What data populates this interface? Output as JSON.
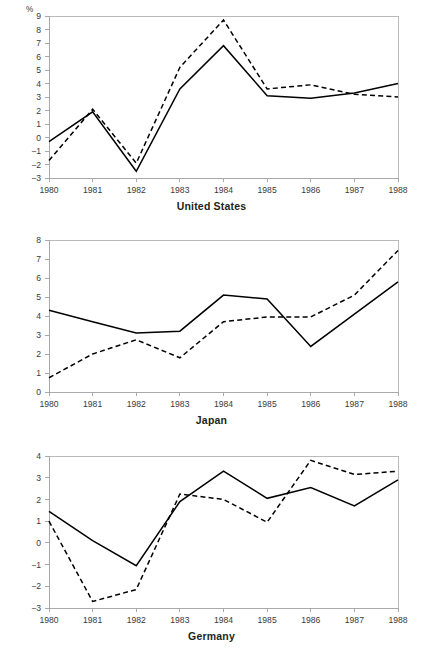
{
  "unit_label": "%",
  "panels": [
    {
      "name": "united-states",
      "title": "United States",
      "ymin": -3,
      "ymax": 9,
      "yticks": [
        -3,
        -2,
        -1,
        0,
        1,
        2,
        3,
        4,
        5,
        6,
        7,
        8,
        9
      ],
      "ytick_labels": [
        "−3",
        "−2",
        "−1",
        "0",
        "1",
        "2",
        "3",
        "4",
        "5",
        "6",
        "7",
        "8",
        "9"
      ],
      "zero_line": 0
    },
    {
      "name": "japan",
      "title": "Japan",
      "ymin": 0,
      "ymax": 8,
      "yticks": [
        0,
        1,
        2,
        3,
        4,
        5,
        6,
        7,
        8
      ],
      "ytick_labels": [
        "0",
        "1",
        "2",
        "3",
        "4",
        "5",
        "6",
        "7",
        "8"
      ],
      "zero_line": 0
    },
    {
      "name": "germany",
      "title": "Germany",
      "ymin": -3,
      "ymax": 4,
      "yticks": [
        -3,
        -2,
        -1,
        0,
        1,
        2,
        3,
        4
      ],
      "ytick_labels": [
        "−3",
        "−2",
        "−1",
        "0",
        "1",
        "2",
        "3",
        "4"
      ],
      "zero_line": 0
    }
  ],
  "chart_data": [
    {
      "type": "line",
      "title": "United States",
      "xlabel": "",
      "ylabel": "%",
      "categories": [
        "1980",
        "1981",
        "1982",
        "1983",
        "1984",
        "1985",
        "1986",
        "1987",
        "1988"
      ],
      "x": [
        1980,
        1981,
        1982,
        1983,
        1984,
        1985,
        1986,
        1987,
        1988
      ],
      "ylim": [
        -3,
        9
      ],
      "yticks": [
        -3,
        -2,
        -1,
        0,
        1,
        2,
        3,
        4,
        5,
        6,
        7,
        8,
        9
      ],
      "grid": false,
      "legend": "none",
      "series": [
        {
          "name": "solid",
          "style": "solid",
          "values": [
            -0.3,
            1.9,
            -2.5,
            3.6,
            6.8,
            3.1,
            2.9,
            3.3,
            4.0
          ]
        },
        {
          "name": "dashed",
          "style": "dashed",
          "values": [
            -1.7,
            2.1,
            -1.9,
            5.2,
            8.7,
            3.6,
            3.9,
            3.2,
            3.0
          ]
        }
      ]
    },
    {
      "type": "line",
      "title": "Japan",
      "xlabel": "",
      "ylabel": "%",
      "categories": [
        "1980",
        "1981",
        "1982",
        "1983",
        "1984",
        "1985",
        "1986",
        "1987",
        "1988"
      ],
      "x": [
        1980,
        1981,
        1982,
        1983,
        1984,
        1985,
        1986,
        1987,
        1988
      ],
      "ylim": [
        0,
        8
      ],
      "yticks": [
        0,
        1,
        2,
        3,
        4,
        5,
        6,
        7,
        8
      ],
      "grid": false,
      "legend": "none",
      "series": [
        {
          "name": "solid",
          "style": "solid",
          "values": [
            4.3,
            3.7,
            3.1,
            3.2,
            5.1,
            4.9,
            2.4,
            4.1,
            5.8
          ]
        },
        {
          "name": "dashed",
          "style": "dashed",
          "values": [
            0.75,
            2.0,
            2.75,
            1.8,
            3.7,
            3.95,
            3.95,
            5.1,
            7.45
          ]
        }
      ]
    },
    {
      "type": "line",
      "title": "Germany",
      "xlabel": "",
      "ylabel": "%",
      "categories": [
        "1980",
        "1981",
        "1982",
        "1983",
        "1984",
        "1985",
        "1986",
        "1987",
        "1988"
      ],
      "x": [
        1980,
        1981,
        1982,
        1983,
        1984,
        1985,
        1986,
        1987,
        1988
      ],
      "ylim": [
        -3,
        4
      ],
      "yticks": [
        -3,
        -2,
        -1,
        0,
        1,
        2,
        3,
        4
      ],
      "grid": false,
      "legend": "none",
      "series": [
        {
          "name": "solid",
          "style": "solid",
          "values": [
            1.45,
            0.1,
            -1.05,
            1.9,
            3.3,
            2.05,
            2.55,
            1.7,
            2.9
          ]
        },
        {
          "name": "dashed",
          "style": "dashed",
          "values": [
            1.0,
            -2.7,
            -2.15,
            2.25,
            2.0,
            0.95,
            3.8,
            3.15,
            3.3
          ]
        }
      ]
    }
  ],
  "xaxis": {
    "categories": [
      "1980",
      "1981",
      "1982",
      "1983",
      "1984",
      "1985",
      "1986",
      "1987",
      "1988"
    ]
  }
}
